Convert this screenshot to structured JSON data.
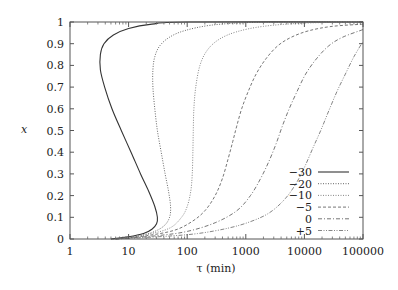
{
  "chart_data": {
    "type": "line",
    "title": "",
    "xlabel": "τ (min)",
    "ylabel": "x",
    "xscale": "log",
    "xlim": [
      1,
      100000
    ],
    "ylim": [
      0,
      1
    ],
    "grid": false,
    "legend_position": "lower right (inside)",
    "x_ticks": [
      {
        "value": 1,
        "label": "1"
      },
      {
        "value": 10,
        "label": "10"
      },
      {
        "value": 100,
        "label": "100"
      },
      {
        "value": 1000,
        "label": "1000"
      },
      {
        "value": 10000,
        "label": "10000"
      },
      {
        "value": 100000,
        "label": "100000"
      }
    ],
    "y_ticks": [
      {
        "value": 0,
        "label": "0"
      },
      {
        "value": 0.1,
        "label": "0.1"
      },
      {
        "value": 0.2,
        "label": "0.2"
      },
      {
        "value": 0.3,
        "label": "0.3"
      },
      {
        "value": 0.4,
        "label": "0.4"
      },
      {
        "value": 0.5,
        "label": "0.5"
      },
      {
        "value": 0.6,
        "label": "0.6"
      },
      {
        "value": 0.7,
        "label": "0.7"
      },
      {
        "value": 0.8,
        "label": "0.8"
      },
      {
        "value": 0.9,
        "label": "0.9"
      },
      {
        "value": 1,
        "label": "1"
      }
    ],
    "series": [
      {
        "name": "−30",
        "style": "solid",
        "color": "#333333",
        "points": [
          [
            5,
            0.0
          ],
          [
            10,
            0.01
          ],
          [
            18,
            0.025
          ],
          [
            25,
            0.045
          ],
          [
            30,
            0.07
          ],
          [
            31,
            0.1
          ],
          [
            28,
            0.15
          ],
          [
            22,
            0.22
          ],
          [
            16,
            0.3
          ],
          [
            11,
            0.4
          ],
          [
            7.5,
            0.5
          ],
          [
            5.2,
            0.6
          ],
          [
            3.9,
            0.7
          ],
          [
            3.3,
            0.78
          ],
          [
            3.3,
            0.85
          ],
          [
            3.8,
            0.9
          ],
          [
            5.5,
            0.94
          ],
          [
            10,
            0.97
          ],
          [
            25,
            0.99
          ],
          [
            100,
            1.0
          ],
          [
            100000,
            1.0
          ]
        ]
      },
      {
        "name": "−20",
        "style": "dotted",
        "color": "#555555",
        "points": [
          [
            5,
            0.0
          ],
          [
            12,
            0.01
          ],
          [
            25,
            0.03
          ],
          [
            40,
            0.06
          ],
          [
            50,
            0.1
          ],
          [
            52,
            0.15
          ],
          [
            48,
            0.22
          ],
          [
            42,
            0.3
          ],
          [
            36,
            0.4
          ],
          [
            31,
            0.5
          ],
          [
            28,
            0.6
          ],
          [
            26,
            0.7
          ],
          [
            26,
            0.78
          ],
          [
            28,
            0.84
          ],
          [
            34,
            0.89
          ],
          [
            50,
            0.93
          ],
          [
            90,
            0.96
          ],
          [
            250,
            0.985
          ],
          [
            1000,
            0.997
          ],
          [
            5000,
            1.0
          ],
          [
            100000,
            1.0
          ]
        ]
      },
      {
        "name": "−10",
        "style": "dotted",
        "color": "#777777",
        "points": [
          [
            6,
            0.0
          ],
          [
            20,
            0.02
          ],
          [
            50,
            0.05
          ],
          [
            80,
            0.1
          ],
          [
            100,
            0.15
          ],
          [
            115,
            0.22
          ],
          [
            122,
            0.3
          ],
          [
            125,
            0.4
          ],
          [
            127,
            0.5
          ],
          [
            130,
            0.6
          ],
          [
            140,
            0.7
          ],
          [
            165,
            0.8
          ],
          [
            220,
            0.87
          ],
          [
            350,
            0.92
          ],
          [
            700,
            0.955
          ],
          [
            2000,
            0.98
          ],
          [
            10000,
            0.995
          ],
          [
            100000,
            1.0
          ]
        ]
      },
      {
        "name": "−5",
        "style": "dashed",
        "color": "#666666",
        "points": [
          [
            6,
            0.0
          ],
          [
            20,
            0.015
          ],
          [
            60,
            0.04
          ],
          [
            120,
            0.08
          ],
          [
            200,
            0.13
          ],
          [
            300,
            0.2
          ],
          [
            400,
            0.28
          ],
          [
            500,
            0.37
          ],
          [
            600,
            0.45
          ],
          [
            700,
            0.52
          ],
          [
            850,
            0.6
          ],
          [
            1100,
            0.68
          ],
          [
            1500,
            0.76
          ],
          [
            2200,
            0.83
          ],
          [
            3500,
            0.89
          ],
          [
            6000,
            0.93
          ],
          [
            12000,
            0.96
          ],
          [
            30000,
            0.98
          ],
          [
            100000,
            0.99
          ]
        ]
      },
      {
        "name": "0",
        "style": "dash-dot",
        "color": "#666666",
        "points": [
          [
            6,
            0.0
          ],
          [
            30,
            0.015
          ],
          [
            100,
            0.035
          ],
          [
            300,
            0.075
          ],
          [
            700,
            0.13
          ],
          [
            1200,
            0.2
          ],
          [
            1800,
            0.28
          ],
          [
            2500,
            0.36
          ],
          [
            3300,
            0.44
          ],
          [
            4200,
            0.52
          ],
          [
            5500,
            0.6
          ],
          [
            7500,
            0.68
          ],
          [
            10500,
            0.76
          ],
          [
            16000,
            0.83
          ],
          [
            26000,
            0.89
          ],
          [
            45000,
            0.93
          ],
          [
            100000,
            0.965
          ]
        ]
      },
      {
        "name": "+5",
        "style": "dash-dot-dot",
        "color": "#777777",
        "points": [
          [
            6,
            0.0
          ],
          [
            40,
            0.012
          ],
          [
            150,
            0.025
          ],
          [
            500,
            0.05
          ],
          [
            1200,
            0.08
          ],
          [
            2500,
            0.12
          ],
          [
            4500,
            0.18
          ],
          [
            7000,
            0.25
          ],
          [
            10000,
            0.33
          ],
          [
            14000,
            0.42
          ],
          [
            19000,
            0.5
          ],
          [
            26000,
            0.59
          ],
          [
            36000,
            0.68
          ],
          [
            50000,
            0.76
          ],
          [
            70000,
            0.84
          ],
          [
            100000,
            0.91
          ]
        ]
      }
    ]
  },
  "legend": {
    "items": [
      {
        "label": "−30"
      },
      {
        "label": "−20"
      },
      {
        "label": "−10"
      },
      {
        "label": "−5"
      },
      {
        "label": "0"
      },
      {
        "label": "+5"
      }
    ]
  },
  "axes": {
    "x_title": "τ (min)",
    "y_title": "x"
  }
}
